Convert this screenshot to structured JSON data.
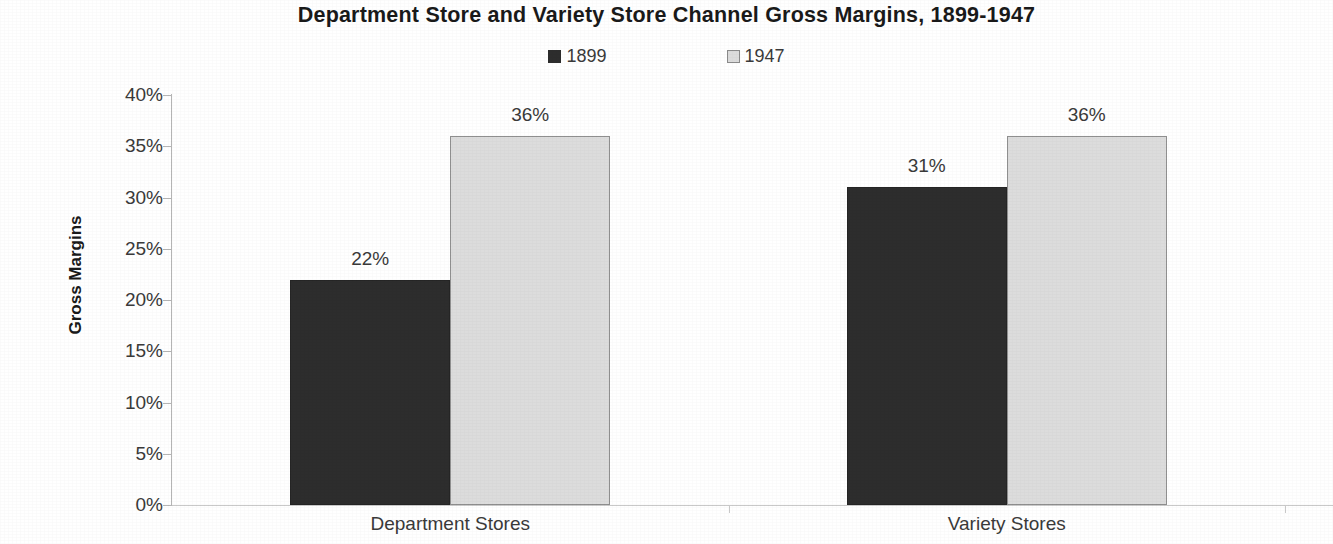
{
  "chart_data": {
    "type": "bar",
    "title": "Department Store and Variety Store Channel Gross Margins, 1899-1947",
    "xlabel": "",
    "ylabel": "Gross Margins",
    "categories": [
      "Department Stores",
      "Variety Stores"
    ],
    "series": [
      {
        "name": "1899",
        "values": [
          22,
          31
        ],
        "labels": [
          "22%",
          "31%"
        ],
        "color": "#2d2d2d"
      },
      {
        "name": "1947",
        "values": [
          36,
          36
        ],
        "labels": [
          "36%",
          "36%"
        ],
        "color": "#dcdcdc"
      }
    ],
    "ylim": [
      0,
      40
    ],
    "ytick_values": [
      40,
      35,
      30,
      25,
      20,
      15,
      10,
      5,
      0
    ],
    "ytick_labels": [
      "40%",
      "35%",
      "30%",
      "25%",
      "20%",
      "15%",
      "10%",
      "5%",
      "0%"
    ],
    "grid": false,
    "legend_position": "top",
    "value_format": "percent"
  },
  "legend": {
    "items": [
      {
        "label": "1899",
        "swatch": "filled-dark-square-icon"
      },
      {
        "label": "1947",
        "swatch": "outlined-light-square-icon"
      }
    ]
  }
}
